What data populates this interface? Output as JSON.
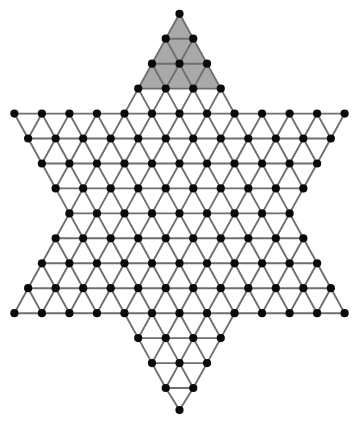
{
  "figure": {
    "name": "star-of-david-triangular-lattice",
    "title": "Hexagram (Star of David) triangular lattice graph",
    "background_color": "#ffffff",
    "width": 362,
    "height": 424
  },
  "style": {
    "vertex_color": "#0a0a0a",
    "vertex_radius": 4.1,
    "edge_color": "#6f6f6f",
    "edge_width": 1.9,
    "shade_color": "#a9a9a9"
  },
  "chart_data": {
    "type": "scatter",
    "xlabel": "",
    "ylabel": "",
    "grid": false,
    "legend": null,
    "lattice": {
      "origin_x": 177.6,
      "origin_y": 13.8,
      "dx": 27.52,
      "dy": 24.95,
      "rows": 16,
      "note": "Row r (0 at top apex) sits at y = origin_y + r*dy. Column index c is offset by row parity; x = center_x + (c - (count-1)/2) * dx."
    },
    "center_x": 179.5,
    "row_counts": [
      1,
      2,
      3,
      4,
      13,
      12,
      11,
      10,
      9,
      10,
      11,
      12,
      13,
      4,
      3,
      2,
      1
    ],
    "row_y": [
      13.8,
      38.7,
      63.7,
      88.6,
      113.6,
      138.5,
      163.5,
      188.4,
      213.4,
      238.3,
      263.3,
      288.2,
      313.2,
      338.1,
      363.1,
      388.0,
      410.0
    ],
    "vertex_count": 121,
    "shaded_region": {
      "name": "top-point-triangle",
      "rows": [
        0,
        1,
        2,
        3
      ],
      "color": "#a9a9a9",
      "apex": [
        177.6,
        13.8
      ],
      "base_left": [
        136.3,
        88.6
      ],
      "base_right": [
        218.9,
        88.6
      ]
    },
    "star_points": {
      "top": [
        177.6,
        13.8
      ],
      "bottom": [
        178.5,
        410.0
      ],
      "left": [
        15.0,
        113.6
      ],
      "right": [
        344.8,
        113.6
      ],
      "lower_left": [
        15.0,
        313.2
      ],
      "lower_right": [
        344.8,
        313.2
      ]
    }
  }
}
